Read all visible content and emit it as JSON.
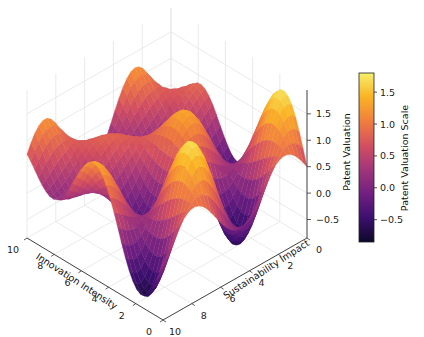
{
  "chart_data": {
    "type": "surface3d",
    "title": "",
    "x_axis": {
      "label": "Innovation Intensity",
      "ticks": [
        0,
        2,
        4,
        6,
        8,
        10
      ],
      "range": [
        0,
        10
      ]
    },
    "y_axis": {
      "label": "Sustainability Impact",
      "ticks": [
        0,
        2,
        4,
        6,
        8,
        10
      ],
      "range": [
        0,
        10
      ]
    },
    "z_axis": {
      "label": "Patent Valuation",
      "ticks": [
        -0.5,
        0.0,
        0.5,
        1.0,
        1.5
      ],
      "tick_labels": [
        "−0.5",
        "0.0",
        "0.5",
        "1.0",
        "1.5"
      ],
      "range": [
        -0.85,
        1.8
      ]
    },
    "colorbar": {
      "label": "Patent Valuation Scale",
      "ticks": [
        -0.5,
        0.0,
        0.5,
        1.0,
        1.5
      ],
      "tick_labels": [
        "−0.5",
        "0.0",
        "0.5",
        "1.0",
        "1.5"
      ],
      "range": [
        -0.85,
        1.8
      ],
      "colormap": "inferno"
    },
    "surface_function": "z ≈ 0.5 + 0.8·sin(x)·cos(y) + 0.45·sin(0.6·x+y)",
    "grid": true,
    "colormap_stops": [
      "#0d0829",
      "#3b0f6f",
      "#6f1f81",
      "#a2357b",
      "#d34f60",
      "#f07c3f",
      "#fbb324",
      "#f5f06a"
    ]
  }
}
